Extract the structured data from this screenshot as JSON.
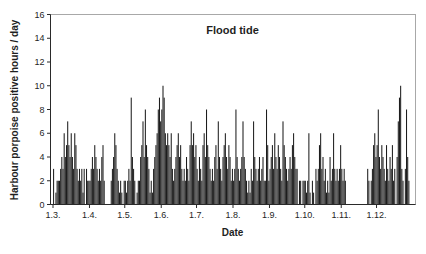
{
  "chart_data": {
    "type": "bar",
    "title": "Flood tide",
    "xlabel": "Date",
    "ylabel": "Harbour porpoise positive hours / day",
    "ylim": [
      0,
      16
    ],
    "yticks": [
      0,
      2,
      4,
      6,
      8,
      10,
      12,
      14,
      16
    ],
    "grid": false,
    "legend": false,
    "bar_color": "#1c1c1c",
    "axis_color": "#2a2a2a",
    "frame_color": "#a8a8a8",
    "x_unit": "day",
    "x_tick_labels": [
      "1.3.",
      "1.4.",
      "1.5.",
      "1.6.",
      "1.7.",
      "1.8.",
      "1.9.",
      "1.10.",
      "1.11.",
      "1.12."
    ],
    "months": [
      {
        "label": "1.3.",
        "values": [
          3,
          0,
          1,
          2,
          2,
          2,
          3,
          4,
          3,
          6,
          4,
          5,
          7,
          5,
          4,
          6,
          4,
          3,
          6,
          5,
          3,
          2,
          3,
          2,
          3,
          1,
          3,
          0,
          3,
          2,
          2
        ]
      },
      {
        "label": "1.4.",
        "values": [
          2,
          3,
          4,
          3,
          5,
          4,
          3,
          2,
          3,
          2,
          4,
          5,
          2,
          0,
          0,
          0,
          0,
          0,
          2,
          3,
          4,
          6,
          5,
          3,
          2,
          1,
          2,
          1,
          0,
          2
        ]
      },
      {
        "label": "1.5.",
        "values": [
          2,
          1,
          2,
          3,
          2,
          9,
          4,
          3,
          2,
          0,
          1,
          2,
          2,
          4,
          5,
          7,
          4,
          8,
          5,
          4,
          3,
          1,
          2,
          1,
          3,
          4,
          5,
          6,
          8,
          9,
          7
        ]
      },
      {
        "label": "1.6.",
        "values": [
          8,
          10,
          9,
          6,
          5,
          6,
          5,
          4,
          6,
          3,
          2,
          3,
          4,
          5,
          6,
          4,
          5,
          3,
          2,
          3,
          2,
          4,
          3,
          2,
          5,
          7,
          5,
          6,
          4,
          5
        ]
      },
      {
        "label": "1.7.",
        "values": [
          3,
          2,
          4,
          3,
          2,
          5,
          6,
          4,
          8,
          5,
          4,
          3,
          2,
          3,
          2,
          4,
          5,
          3,
          7,
          4,
          3,
          2,
          4,
          5,
          6,
          4,
          3,
          5,
          4,
          2,
          3
        ]
      },
      {
        "label": "1.8.",
        "values": [
          2,
          3,
          8,
          4,
          3,
          2,
          3,
          4,
          7,
          4,
          3,
          2,
          1,
          2,
          1,
          3,
          2,
          7,
          4,
          3,
          2,
          3,
          4,
          2,
          3,
          4,
          2,
          2,
          8,
          5,
          2
        ]
      },
      {
        "label": "1.9.",
        "values": [
          3,
          4,
          5,
          3,
          6,
          4,
          3,
          5,
          4,
          3,
          2,
          7,
          5,
          4,
          3,
          2,
          3,
          4,
          3,
          5,
          6,
          4,
          3,
          3,
          0,
          2,
          2,
          0,
          2,
          2
        ]
      },
      {
        "label": "1.10.",
        "values": [
          2,
          1,
          2,
          6,
          1,
          0,
          2,
          1,
          0,
          3,
          2,
          3,
          5,
          6,
          3,
          4,
          2,
          3,
          1,
          2,
          1,
          4,
          2,
          3,
          6,
          3,
          2,
          3,
          2,
          3,
          5
        ]
      },
      {
        "label": "1.11.",
        "values": [
          3,
          2,
          3,
          2,
          0,
          0,
          0,
          0,
          0,
          0,
          0,
          0,
          0,
          0,
          0,
          0,
          0,
          0,
          0,
          0,
          0,
          0,
          3,
          2,
          0,
          2,
          3,
          5,
          6,
          4
        ]
      },
      {
        "label": "1.12.",
        "values": [
          5,
          8,
          4,
          3,
          5,
          4,
          3,
          2,
          5,
          3,
          2,
          4,
          3,
          5,
          2,
          3,
          0,
          4,
          7,
          9,
          10,
          3,
          2,
          0,
          3,
          8,
          4,
          2,
          0,
          0,
          0
        ]
      }
    ]
  }
}
